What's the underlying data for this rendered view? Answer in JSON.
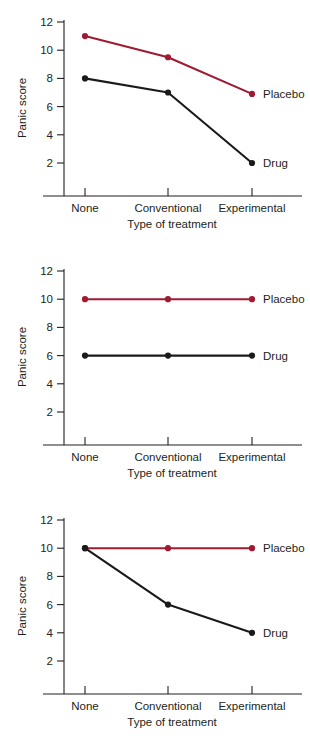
{
  "figure": {
    "background_color": "#ffffff",
    "axis_color": "#231f20",
    "panel_count": 3
  },
  "colors": {
    "placebo": "#9e1b32",
    "drug": "#1a1a1a",
    "axis": "#231f20",
    "text": "#231f20"
  },
  "axis": {
    "ylabel": "Panic score",
    "xlabel": "Type of treatment",
    "ytick_labels": [
      "2",
      "4",
      "6",
      "8",
      "10",
      "12"
    ],
    "categories": [
      "None",
      "Conventional",
      "Experimental"
    ]
  },
  "legend": {
    "placebo": "Placebo",
    "drug": "Drug"
  },
  "chart_data": [
    {
      "type": "line",
      "panel": 1,
      "title": "",
      "xlabel": "Type of treatment",
      "ylabel": "Panic score",
      "categories": [
        "None",
        "Conventional",
        "Experimental"
      ],
      "ylim": [
        0,
        12
      ],
      "yticks": [
        2,
        4,
        6,
        8,
        10,
        12
      ],
      "grid": false,
      "legend_position": "right-inline",
      "series": [
        {
          "name": "Placebo",
          "color": "#9e1b32",
          "values": [
            11.0,
            9.5,
            6.9
          ]
        },
        {
          "name": "Drug",
          "color": "#1a1a1a",
          "values": [
            8.0,
            7.0,
            2.0
          ]
        }
      ]
    },
    {
      "type": "line",
      "panel": 2,
      "title": "",
      "xlabel": "Type of treatment",
      "ylabel": "Panic score",
      "categories": [
        "None",
        "Conventional",
        "Experimental"
      ],
      "ylim": [
        0,
        12
      ],
      "yticks": [
        2,
        4,
        6,
        8,
        10,
        12
      ],
      "grid": false,
      "legend_position": "right-inline",
      "series": [
        {
          "name": "Placebo",
          "color": "#9e1b32",
          "values": [
            10.0,
            10.0,
            10.0
          ]
        },
        {
          "name": "Drug",
          "color": "#1a1a1a",
          "values": [
            6.0,
            6.0,
            6.0
          ]
        }
      ]
    },
    {
      "type": "line",
      "panel": 3,
      "title": "",
      "xlabel": "Type of treatment",
      "ylabel": "Panic score",
      "categories": [
        "None",
        "Conventional",
        "Experimental"
      ],
      "ylim": [
        0,
        12
      ],
      "yticks": [
        2,
        4,
        6,
        8,
        10,
        12
      ],
      "grid": false,
      "legend_position": "right-inline",
      "series": [
        {
          "name": "Placebo",
          "color": "#9e1b32",
          "values": [
            10.0,
            10.0,
            10.0
          ]
        },
        {
          "name": "Drug",
          "color": "#1a1a1a",
          "values": [
            10.0,
            6.0,
            4.0
          ]
        }
      ]
    }
  ]
}
